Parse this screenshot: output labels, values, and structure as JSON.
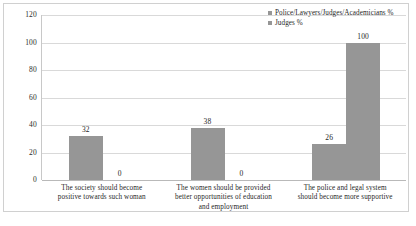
{
  "chart_data": {
    "type": "bar",
    "title": "",
    "subtitle": "",
    "xlabel": "",
    "ylabel": "",
    "ylim": [
      0,
      120
    ],
    "yticks": [
      "0",
      "20",
      "40",
      "60",
      "80",
      "100",
      "120"
    ],
    "grid": "horizontal",
    "legend_position": "top-right",
    "categories": [
      "The society should become positive towards such woman",
      "The women should be provided better opportunities of education and employment",
      "The police and legal system should become more supportive"
    ],
    "category_lines": [
      [
        "The society should become",
        "positive towards such woman"
      ],
      [
        "The women should be provided",
        "better opportunities of education",
        "and employment"
      ],
      [
        "The police and legal system",
        "should become more supportive"
      ]
    ],
    "series": [
      {
        "name": "Police/Lawyers/Judges/Academicians %",
        "color": "#969696",
        "values": [
          32,
          38,
          26
        ],
        "labels": [
          "32",
          "38",
          "26"
        ]
      },
      {
        "name": "Judges %",
        "color": "#969696",
        "values": [
          0,
          0,
          100
        ],
        "labels": [
          "0",
          "0",
          "100"
        ]
      }
    ]
  },
  "legend": {
    "items": [
      {
        "label": "Police/Lawyers/Judges/Academicians %",
        "color": "#969696"
      },
      {
        "label": "Judges %",
        "color": "#969696"
      }
    ]
  }
}
